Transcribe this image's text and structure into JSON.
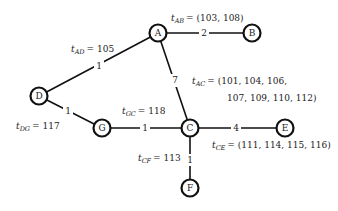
{
  "graph": {
    "nodes": [
      {
        "id": "A",
        "label": "A"
      },
      {
        "id": "B",
        "label": "B"
      },
      {
        "id": "C",
        "label": "C"
      },
      {
        "id": "D",
        "label": "D"
      },
      {
        "id": "E",
        "label": "E"
      },
      {
        "id": "F",
        "label": "F"
      },
      {
        "id": "G",
        "label": "G"
      }
    ],
    "edges": [
      {
        "from": "A",
        "to": "B",
        "weight": "2",
        "annotation": {
          "var": "t",
          "sub": "AB",
          "value": "= (103, 108)"
        }
      },
      {
        "from": "A",
        "to": "D",
        "weight": "1",
        "annotation": {
          "var": "t",
          "sub": "AD",
          "value": "= 105"
        }
      },
      {
        "from": "A",
        "to": "C",
        "weight": "7",
        "annotation": {
          "var": "t",
          "sub": "AC",
          "value": "= (101, 104, 106,",
          "value2": "107, 109, 110, 112)"
        }
      },
      {
        "from": "D",
        "to": "G",
        "weight": "1",
        "annotation": {
          "var": "t",
          "sub": "DG",
          "value": "= 117"
        }
      },
      {
        "from": "G",
        "to": "C",
        "weight": "1",
        "annotation": {
          "var": "t",
          "sub": "GC",
          "value": "= 118"
        }
      },
      {
        "from": "C",
        "to": "E",
        "weight": "4",
        "annotation": {
          "var": "t",
          "sub": "CE",
          "value": "= (111, 114, 115, 116)"
        }
      },
      {
        "from": "C",
        "to": "F",
        "weight": "1",
        "annotation": {
          "var": "t",
          "sub": "CF",
          "value": "= 113"
        }
      }
    ]
  }
}
